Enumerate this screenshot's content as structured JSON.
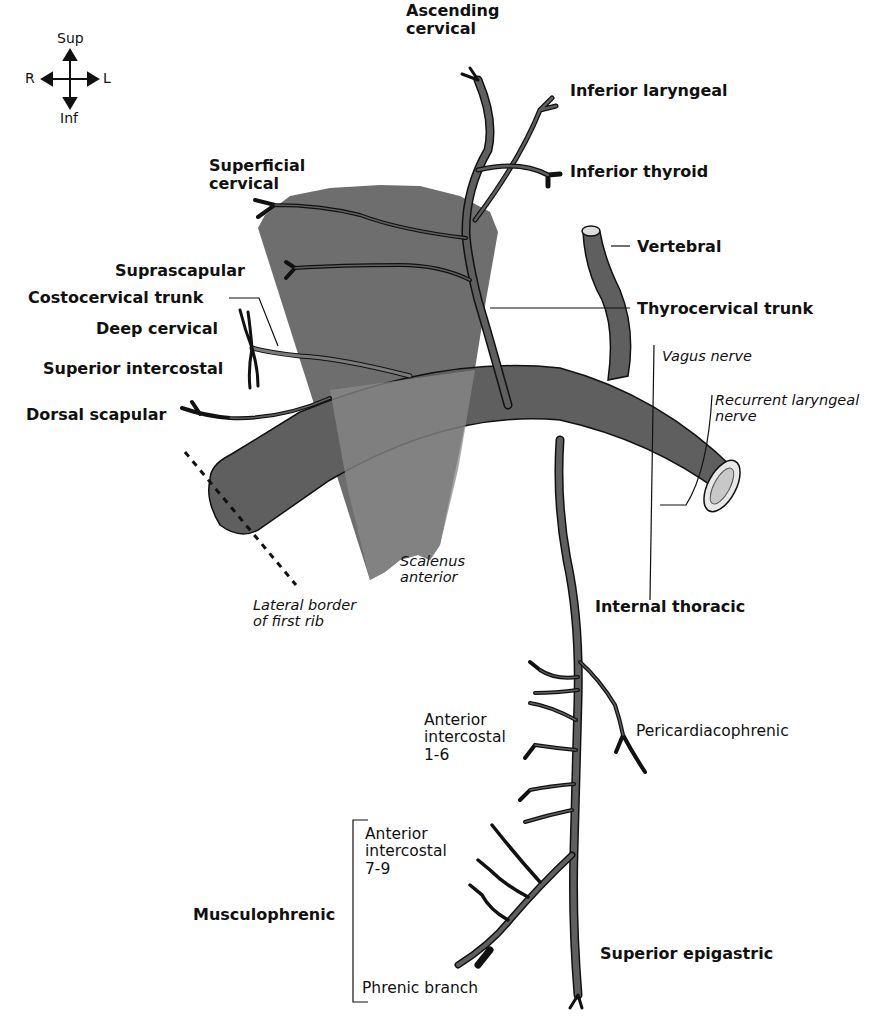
{
  "compass": {
    "up": "Sup",
    "down": "Inf",
    "left": "R",
    "right": "L"
  },
  "labels": {
    "ascending_cervical": [
      "Ascending",
      "cervical"
    ],
    "inferior_laryngeal": "Inferior laryngeal",
    "inferior_thyroid": "Inferior thyroid",
    "superficial_cervical": [
      "Superficial",
      "cervical"
    ],
    "vertebral": "Vertebral",
    "suprascapular": "Suprascapular",
    "costocervical_trunk": "Costocervical trunk",
    "thyrocervical_trunk": "Thyrocervical trunk",
    "deep_cervical": "Deep cervical",
    "superior_intercostal": "Superior intercostal",
    "vagus_nerve": "Vagus nerve",
    "recurrent_laryngeal_nerve": [
      "Recurrent laryngeal",
      "nerve"
    ],
    "dorsal_scapular": "Dorsal scapular",
    "scalenus_anterior": [
      "Scalenus",
      "anterior"
    ],
    "lateral_border_first_rib": [
      "Lateral border",
      "of first rib"
    ],
    "internal_thoracic": "Internal thoracic",
    "anterior_intercostal_1_6": [
      "Anterior",
      "intercostal",
      "1-6"
    ],
    "pericardiacophrenic": "Pericardiacophrenic",
    "anterior_intercostal_7_9": [
      "Anterior",
      "intercostal",
      "7-9"
    ],
    "musculophrenic": "Musculophrenic",
    "superior_epigastric": "Superior epigastric",
    "phrenic_branch": "Phrenic branch"
  },
  "colors": {
    "vessel": "#5f5f5f",
    "vessel_outline": "#111111",
    "muscle": "#6e6e6e",
    "muscle_overlap": "#8a8a8a",
    "lumen": "#d6d6d6",
    "line": "#111111",
    "background": "#ffffff"
  }
}
